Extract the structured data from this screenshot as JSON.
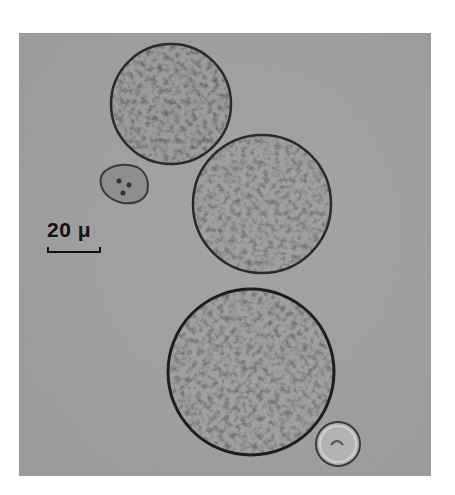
{
  "figure": {
    "scale_bar": {
      "label": "20 μ"
    },
    "colors": {
      "background": "#a9a9a9",
      "cell_fill": "#9a9a9a",
      "cell_edge": "#2a2a2a",
      "page": "#ffffff"
    }
  }
}
